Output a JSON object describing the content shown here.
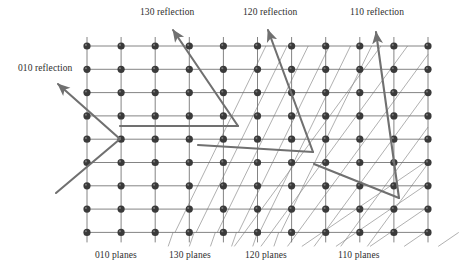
{
  "figure": {
    "type": "crystal-lattice-bragg-reflection-diagram",
    "background_color": "#ffffff",
    "node_color": "#3a3a3a",
    "grid_line_color": "#6f6f6f",
    "ray_color": "#707070",
    "plane_line_color": "#8a8a8a",
    "text_color": "#2e2e2e"
  },
  "lattice": {
    "columns": 11,
    "rows": 9,
    "x_start": 87,
    "y_start": 46,
    "x_spacing": 34.1,
    "y_spacing": 23.3,
    "node_radius": 3.6
  },
  "reflection_labels": [
    {
      "id": "010",
      "text": "010 reflection",
      "x": 18,
      "y": 68
    },
    {
      "id": "130",
      "text": "130 reflection",
      "x": 140,
      "y": 10
    },
    {
      "id": "120",
      "text": "120 reflection",
      "x": 240,
      "y": 10
    },
    {
      "id": "110",
      "text": "110 reflection",
      "x": 350,
      "y": 10
    }
  ],
  "plane_labels": [
    {
      "id": "010",
      "text": "010 planes",
      "x": 95,
      "y": 252
    },
    {
      "id": "130",
      "text": "130 planes",
      "x": 168,
      "y": 252
    },
    {
      "id": "120",
      "text": "120 planes",
      "x": 243,
      "y": 252
    },
    {
      "id": "110",
      "text": "110 planes",
      "x": 337,
      "y": 252
    }
  ],
  "rays": [
    {
      "id": "010",
      "incident": {
        "x1": 56,
        "y1": 193,
        "x2": 120,
        "y2": 139
      },
      "reflected": {
        "x1": 120,
        "y1": 139,
        "x2": 58,
        "y2": 84
      }
    },
    {
      "id": "130",
      "incident": {
        "x1": 120,
        "y1": 126,
        "x2": 238,
        "y2": 126
      },
      "reflected": {
        "x1": 238,
        "y1": 126,
        "x2": 173,
        "y2": 30
      }
    },
    {
      "id": "120",
      "incident": {
        "x1": 198,
        "y1": 145,
        "x2": 313,
        "y2": 152
      },
      "reflected": {
        "x1": 313,
        "y1": 152,
        "x2": 268,
        "y2": 30
      }
    },
    {
      "id": "110",
      "incident": {
        "x1": 314,
        "y1": 164,
        "x2": 399,
        "y2": 198
      },
      "reflected": {
        "x1": 399,
        "y1": 198,
        "x2": 376,
        "y2": 32
      }
    }
  ],
  "plane_families": [
    {
      "id": "010",
      "description": "vertical planes",
      "orientation": "vertical"
    },
    {
      "id": "130",
      "description": "steep diagonal planes",
      "orientation": "steep-diagonal"
    },
    {
      "id": "120",
      "description": "medium diagonal planes",
      "orientation": "medium-diagonal"
    },
    {
      "id": "110",
      "description": "45 degree diagonal planes",
      "orientation": "45-degree"
    }
  ],
  "chart_data": {
    "type": "diagram",
    "categories": [
      "010",
      "130",
      "120",
      "110"
    ],
    "series": [
      {
        "name": "reflection_label",
        "values": [
          "010 reflection",
          "130 reflection",
          "120 reflection",
          "110 reflection"
        ]
      },
      {
        "name": "plane_label",
        "values": [
          "010 planes",
          "130 planes",
          "120 planes",
          "110 planes"
        ]
      }
    ]
  }
}
